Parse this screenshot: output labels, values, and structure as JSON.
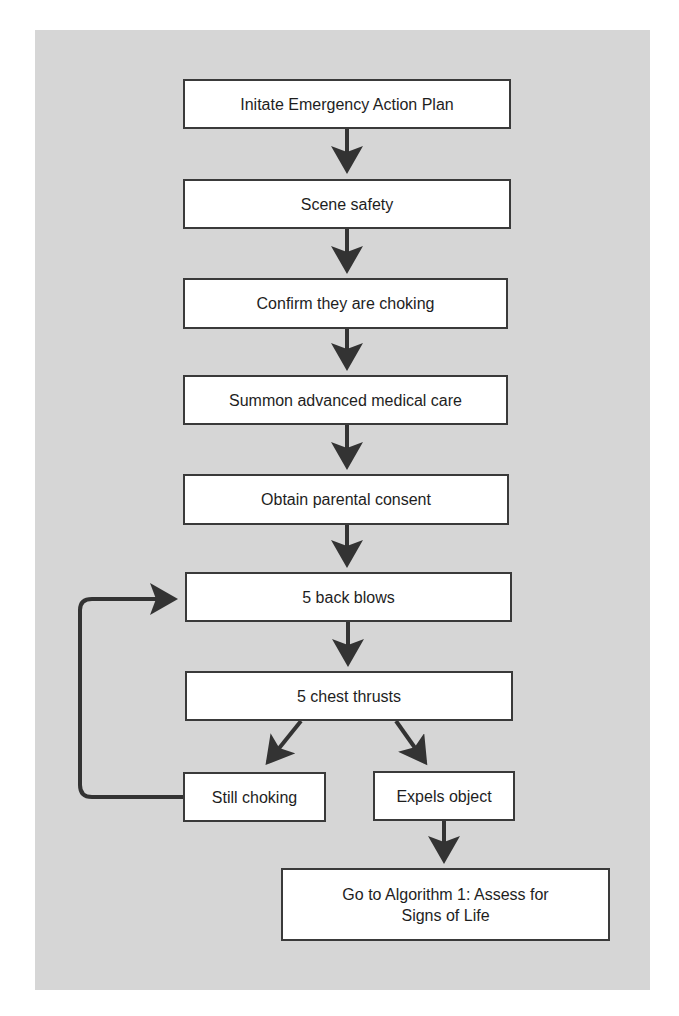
{
  "diagram": {
    "type": "flowchart",
    "colors": {
      "background": "#d6d6d6",
      "box_fill": "#ffffff",
      "box_border": "#3a3a3a",
      "arrow": "#333333",
      "text": "#1e1e1e"
    },
    "nodes": [
      {
        "id": "n1",
        "label": "Initate Emergency Action Plan"
      },
      {
        "id": "n2",
        "label": "Scene safety"
      },
      {
        "id": "n3",
        "label": "Confirm they are choking"
      },
      {
        "id": "n4",
        "label": "Summon advanced medical care"
      },
      {
        "id": "n5",
        "label": "Obtain parental consent"
      },
      {
        "id": "n6",
        "label": "5 back blows"
      },
      {
        "id": "n7",
        "label": "5 chest thrusts"
      },
      {
        "id": "n8",
        "label": "Still choking"
      },
      {
        "id": "n9",
        "label": "Expels object"
      },
      {
        "id": "n10",
        "label": "Go to Algorithm 1: Assess for Signs of Life"
      }
    ],
    "edges": [
      {
        "from": "n1",
        "to": "n2"
      },
      {
        "from": "n2",
        "to": "n3"
      },
      {
        "from": "n3",
        "to": "n4"
      },
      {
        "from": "n4",
        "to": "n5"
      },
      {
        "from": "n5",
        "to": "n6"
      },
      {
        "from": "n6",
        "to": "n7"
      },
      {
        "from": "n7",
        "to": "n8"
      },
      {
        "from": "n7",
        "to": "n9"
      },
      {
        "from": "n8",
        "to": "n6",
        "style": "loop-back"
      },
      {
        "from": "n9",
        "to": "n10"
      }
    ]
  }
}
